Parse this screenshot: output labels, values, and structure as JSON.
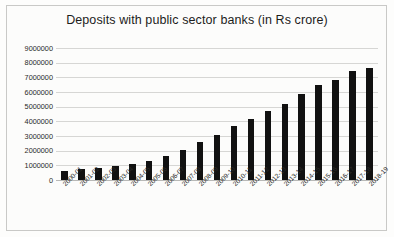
{
  "chart_data": {
    "type": "bar",
    "title": "Deposits with public sector banks (in Rs crore)",
    "xlabel": "",
    "ylabel": "",
    "ylim": [
      0,
      9000000
    ],
    "ytick_labels": [
      "9000000",
      "8000000",
      "7000000",
      "6000000",
      "5000000",
      "4000000",
      "3000000",
      "2000000",
      "1000000",
      "0"
    ],
    "ytick_values": [
      9000000,
      8000000,
      7000000,
      6000000,
      5000000,
      4000000,
      3000000,
      2000000,
      1000000,
      0
    ],
    "grid": true,
    "legend": false,
    "bar_color": "#111111",
    "plot_background": "#fcfcfb",
    "gridline_color": "#d6d6d4",
    "categories": [
      "2000-01",
      "2001-02",
      "2002-03",
      "2003-04",
      "2004-05",
      "2005-06",
      "2006-07",
      "2007-08",
      "2008-09",
      "2009-10",
      "2010-11",
      "2011-12",
      "2012-13",
      "2013-14",
      "2014-15",
      "2015-16",
      "2016-17",
      "2017-18",
      "2018-19"
    ],
    "values": [
      620000,
      730000,
      830000,
      970000,
      1110000,
      1330000,
      1620000,
      2030000,
      2570000,
      3090000,
      3650000,
      4180000,
      4700000,
      5200000,
      5880000,
      6480000,
      6790000,
      7440000,
      7640000
    ],
    "values_last": 7900000
  }
}
